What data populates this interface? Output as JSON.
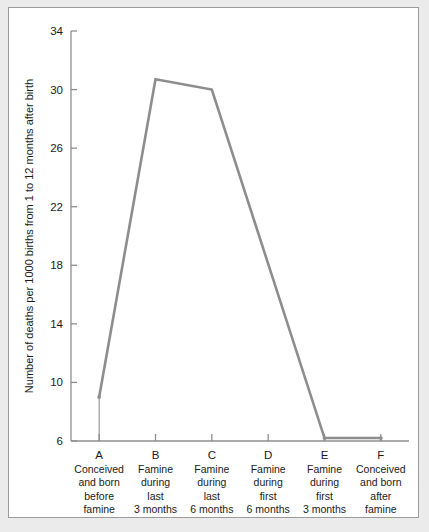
{
  "chart_data": {
    "type": "line",
    "title": "",
    "xlabel": "",
    "ylabel": "Number of deaths per 1000 births from 1 to 12 months after birth",
    "categories": [
      "A",
      "B",
      "C",
      "D",
      "E",
      "F"
    ],
    "category_descriptions": [
      [
        "Conceived",
        "and born",
        "before",
        "famine"
      ],
      [
        "Famine",
        "during",
        "last",
        "3 months"
      ],
      [
        "Famine",
        "during",
        "last",
        "6 months"
      ],
      [
        "Famine",
        "during",
        "first",
        "6 months"
      ],
      [
        "Famine",
        "during",
        "first",
        "3 months"
      ],
      [
        "Conceived",
        "and born",
        "after",
        "famine"
      ]
    ],
    "values": [
      9.0,
      30.7,
      30.0,
      null,
      6.2,
      6.2
    ],
    "marked_points": [
      "A",
      "B",
      "C",
      "E",
      "F"
    ],
    "ylim": [
      6,
      34
    ],
    "yticks": [
      6,
      10,
      14,
      18,
      22,
      26,
      30,
      34
    ],
    "ytick_labels": [
      "6",
      "10",
      "14",
      "18",
      "22",
      "26",
      "30",
      "34"
    ],
    "grid": false,
    "legend": "none",
    "note": "Line segment runs straight from C to E with no vertex at D",
    "line_color": "#8d8d8d",
    "axis_color": "#8e8e8e",
    "text_color": "#1a1a1a",
    "plot_background": "#ffffff",
    "page_background": "#ebebeb"
  }
}
